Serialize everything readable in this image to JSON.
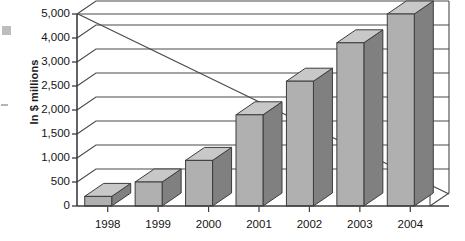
{
  "chart_data": {
    "type": "bar",
    "title": "",
    "subtitle": "",
    "xlabel": "",
    "ylabel": "In $ millions",
    "categories": [
      "1998",
      "1999",
      "2000",
      "2001",
      "2002",
      "2003",
      "2004"
    ],
    "values": [
      200,
      500,
      950,
      1900,
      2600,
      3800,
      5000
    ],
    "series": [
      {
        "name": "In $ millions",
        "values": [
          200,
          500,
          950,
          1900,
          2600,
          3800,
          5000
        ]
      }
    ],
    "ytick_labels": [
      "0",
      "500",
      "1,000",
      "1,500",
      "2,000",
      "2,500",
      "3,000",
      "4,000",
      "5,000"
    ],
    "ytick_values": [
      0,
      500,
      1000,
      1500,
      2000,
      2500,
      3000,
      4000,
      5000
    ],
    "ylim": [
      0,
      5000
    ],
    "yaxis_scale": "categorical-uneven",
    "grid": true,
    "gridlines": "horizontal",
    "legend": "none",
    "style": "3d-bars",
    "annotations": [
      {
        "name": "back-wall-diagonal",
        "description": "diagonal edge of the 3D back wall running from the 5,000 gridline at the y-axis down to the baseline at the right"
      }
    ],
    "colors": {
      "bar_front": "#b0b0b0",
      "bar_side": "#808080",
      "bar_top": "#c8c8c8",
      "outline": "#3c3c3c",
      "axis": "#3c3c3c",
      "grid": "#4a4a4a",
      "text": "#141414",
      "background": "#ffffff"
    }
  }
}
